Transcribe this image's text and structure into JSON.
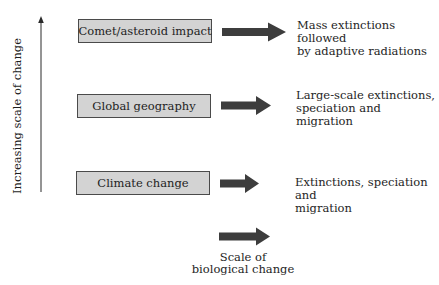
{
  "axis": {
    "label": "Increasing scale of change"
  },
  "rows": [
    {
      "cause": "Comet/asteroid impact",
      "effect_lines": [
        "Mass extinctions followed",
        "by adaptive radiations"
      ]
    },
    {
      "cause": "Global geography",
      "effect_lines": [
        "Large-scale extinctions,",
        "speciation and",
        "migration"
      ]
    },
    {
      "cause": "Climate change",
      "effect_lines": [
        "Extinctions, speciation and",
        "migration"
      ]
    }
  ],
  "legend": {
    "line1": "Scale of",
    "line2": "biological change"
  },
  "colors": {
    "box_fill": "#d3d3d3",
    "box_border": "#4a4a4a",
    "arrow": "#3d3d3d",
    "text": "#1e1e1e"
  }
}
